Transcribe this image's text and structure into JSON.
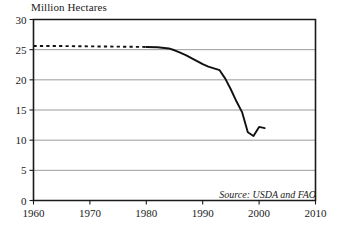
{
  "chart_data": {
    "type": "line",
    "title": "Million Hectares",
    "xlabel": "",
    "ylabel": "Million Hectares",
    "xlim": [
      1960,
      2010
    ],
    "ylim": [
      0,
      30
    ],
    "xticks": [
      1960,
      1970,
      1980,
      1990,
      2000,
      2010
    ],
    "yticks": [
      0,
      5,
      10,
      15,
      20,
      25,
      30
    ],
    "grid": "horizontal",
    "legend": "none",
    "annotations": [
      {
        "name": "source-note",
        "text": "Source: USDA and FAO"
      }
    ],
    "series": [
      {
        "name": "Estimated area (dashed)",
        "style": "dotted",
        "x": [
          1960,
          1965,
          1970,
          1975,
          1980
        ],
        "values": [
          25.6,
          25.6,
          25.55,
          25.5,
          25.45
        ]
      },
      {
        "name": "Reported area (solid)",
        "style": "solid",
        "x": [
          1980,
          1982,
          1984,
          1985,
          1986,
          1987,
          1988,
          1989,
          1990,
          1991,
          1992,
          1993,
          1994,
          1995,
          1996,
          1997,
          1998,
          1999,
          2000,
          2001
        ],
        "values": [
          25.45,
          25.4,
          25.2,
          24.9,
          24.5,
          24.1,
          23.6,
          23.1,
          22.6,
          22.2,
          21.9,
          21.6,
          20.2,
          18.4,
          16.4,
          14.6,
          11.3,
          10.7,
          12.2,
          12.0
        ]
      }
    ]
  }
}
